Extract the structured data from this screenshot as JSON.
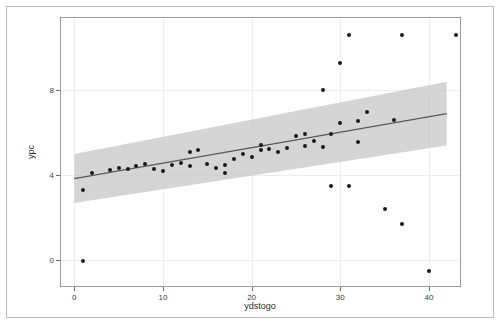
{
  "chart_data": {
    "type": "scatter",
    "title": "",
    "subtitle": "",
    "xlabel": "ydstogo",
    "ylabel": "ypc",
    "xlim": [
      -1.5,
      43.5
    ],
    "ylim": [
      -1.2,
      11.4
    ],
    "xticks": [
      0,
      10,
      20,
      30,
      40
    ],
    "xticklabels": [
      "0",
      "10",
      "20",
      "30",
      "40"
    ],
    "yticks": [
      0,
      4,
      8
    ],
    "yticklabels": [
      "0",
      "4",
      "8"
    ],
    "grid": true,
    "grid_color": "#ededed",
    "legend": "none",
    "point_color": "#1a1a1a",
    "line_color": "#595959",
    "band_color": "#c9c9c9",
    "panel_border_color": "#9a9a9a",
    "points": [
      {
        "x": 1,
        "y": 0.0
      },
      {
        "x": 1,
        "y": 3.3
      },
      {
        "x": 2,
        "y": 4.1
      },
      {
        "x": 4,
        "y": 4.25
      },
      {
        "x": 5,
        "y": 4.35
      },
      {
        "x": 6,
        "y": 4.3
      },
      {
        "x": 7,
        "y": 4.45
      },
      {
        "x": 8,
        "y": 4.55
      },
      {
        "x": 9,
        "y": 4.3
      },
      {
        "x": 10,
        "y": 4.2
      },
      {
        "x": 11,
        "y": 4.5
      },
      {
        "x": 12,
        "y": 4.6
      },
      {
        "x": 13,
        "y": 5.1
      },
      {
        "x": 13,
        "y": 4.45
      },
      {
        "x": 14,
        "y": 5.2
      },
      {
        "x": 15,
        "y": 4.55
      },
      {
        "x": 16,
        "y": 4.35
      },
      {
        "x": 17,
        "y": 4.5
      },
      {
        "x": 17,
        "y": 4.1
      },
      {
        "x": 18,
        "y": 4.75
      },
      {
        "x": 19,
        "y": 5.0
      },
      {
        "x": 20,
        "y": 4.85
      },
      {
        "x": 21,
        "y": 5.2
      },
      {
        "x": 21,
        "y": 5.45
      },
      {
        "x": 22,
        "y": 5.25
      },
      {
        "x": 23,
        "y": 5.1
      },
      {
        "x": 24,
        "y": 5.3
      },
      {
        "x": 25,
        "y": 5.85
      },
      {
        "x": 26,
        "y": 5.95
      },
      {
        "x": 26,
        "y": 5.4
      },
      {
        "x": 27,
        "y": 5.6
      },
      {
        "x": 28,
        "y": 5.35
      },
      {
        "x": 28,
        "y": 8.0
      },
      {
        "x": 29,
        "y": 5.95
      },
      {
        "x": 29,
        "y": 3.5
      },
      {
        "x": 30,
        "y": 6.45
      },
      {
        "x": 30,
        "y": 9.3
      },
      {
        "x": 31,
        "y": 3.5
      },
      {
        "x": 31,
        "y": 10.6
      },
      {
        "x": 32,
        "y": 6.55
      },
      {
        "x": 32,
        "y": 5.55
      },
      {
        "x": 33,
        "y": 7.0
      },
      {
        "x": 35,
        "y": 2.4
      },
      {
        "x": 36,
        "y": 6.6
      },
      {
        "x": 37,
        "y": 10.6
      },
      {
        "x": 37,
        "y": 1.7
      },
      {
        "x": 40,
        "y": -0.5
      },
      {
        "x": 43,
        "y": 10.6
      }
    ],
    "fit_line": {
      "x_start": 0,
      "x_end": 42,
      "y_start": 3.85,
      "y_end": 6.9
    },
    "confidence_band": {
      "x_start": 0,
      "x_end": 42,
      "upper_start": 5.0,
      "upper_end": 8.4,
      "lower_start": 2.7,
      "lower_end": 5.4
    }
  }
}
